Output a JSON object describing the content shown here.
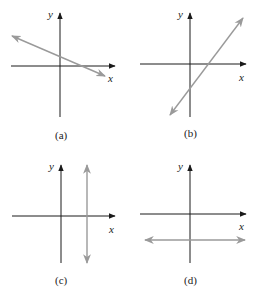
{
  "figure": {
    "top_partial_text": "",
    "panels": [
      {
        "id": "a",
        "label": "(a)",
        "x_axis_label": "x",
        "y_axis_label": "y",
        "line_type": "negative-slope",
        "description": "Line with negative slope, positive y-intercept"
      },
      {
        "id": "b",
        "label": "(b)",
        "x_axis_label": "x",
        "y_axis_label": "y",
        "line_type": "positive-slope",
        "description": "Line with positive slope, negative y-intercept"
      },
      {
        "id": "c",
        "label": "(c)",
        "x_axis_label": "x",
        "y_axis_label": "y",
        "line_type": "vertical",
        "description": "Vertical line at positive x"
      },
      {
        "id": "d",
        "label": "(d)",
        "x_axis_label": "x",
        "y_axis_label": "y",
        "line_type": "horizontal",
        "description": "Horizontal line at negative y"
      }
    ],
    "colors": {
      "axis": "#1a1a1a",
      "line": "#9a9a9a",
      "background": "#ffffff"
    }
  }
}
